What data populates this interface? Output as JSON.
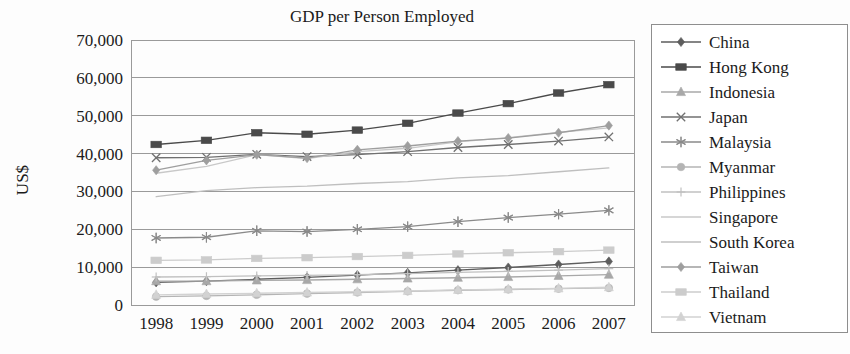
{
  "chart_data": {
    "type": "line",
    "title": "GDP per Person Employed",
    "xlabel": "",
    "ylabel": "US$",
    "x": [
      1998,
      1999,
      2000,
      2001,
      2002,
      2003,
      2004,
      2005,
      2006,
      2007
    ],
    "categories": [
      "1998",
      "1999",
      "2000",
      "2001",
      "2002",
      "2003",
      "2004",
      "2005",
      "2006",
      "2007"
    ],
    "ylim": [
      0,
      70000
    ],
    "yticks": [
      0,
      10000,
      20000,
      30000,
      40000,
      50000,
      60000,
      70000
    ],
    "ytick_labels": [
      "0",
      "10,000",
      "20,000",
      "30,000",
      "40,000",
      "50,000",
      "60,000",
      "70,000"
    ],
    "grid": true,
    "legend_position": "right",
    "series": [
      {
        "name": "China",
        "marker": "diamond",
        "color": "#5d5d5d",
        "values": [
          6000,
          6300,
          6800,
          7300,
          7900,
          8500,
          9200,
          9900,
          10700,
          11500
        ]
      },
      {
        "name": "Hong Kong",
        "marker": "square",
        "color": "#4a4a4a",
        "values": [
          42400,
          43500,
          45500,
          45100,
          46200,
          48000,
          50700,
          53200,
          56000,
          58200
        ]
      },
      {
        "name": "Indonesia",
        "marker": "triangle",
        "color": "#a8a8a8",
        "values": [
          6300,
          6300,
          6500,
          6600,
          6800,
          7000,
          7200,
          7400,
          7700,
          8000
        ]
      },
      {
        "name": "Japan",
        "marker": "cross",
        "color": "#707070",
        "values": [
          38900,
          39000,
          39800,
          39200,
          39700,
          40500,
          41600,
          42400,
          43300,
          44400
        ]
      },
      {
        "name": "Malaysia",
        "marker": "star",
        "color": "#8a8a8a",
        "values": [
          17700,
          17900,
          19600,
          19400,
          20000,
          20700,
          22000,
          23100,
          24000,
          25000
        ]
      },
      {
        "name": "Myanmar",
        "marker": "circle",
        "color": "#b4b4b4",
        "values": [
          2200,
          2400,
          2700,
          3000,
          3300,
          3600,
          3900,
          4100,
          4300,
          4500
        ]
      },
      {
        "name": "Philippines",
        "marker": "plus",
        "color": "#c0c0c0",
        "values": [
          7400,
          7500,
          7700,
          7800,
          8000,
          8300,
          8600,
          8900,
          9200,
          9600
        ]
      },
      {
        "name": "Singapore",
        "marker": "none",
        "color": "#c8c8c8",
        "values": [
          34800,
          36600,
          39700,
          38700,
          40500,
          41400,
          43100,
          44200,
          45600,
          46800
        ]
      },
      {
        "name": "South Korea",
        "marker": "none",
        "color": "#bfbfbf",
        "values": [
          28600,
          30200,
          31000,
          31400,
          32100,
          32600,
          33600,
          34200,
          35200,
          36200
        ]
      },
      {
        "name": "Taiwan",
        "marker": "diamond",
        "color": "#9e9e9e",
        "values": [
          35600,
          38200,
          39700,
          38800,
          41000,
          42000,
          43300,
          44100,
          45500,
          47400
        ]
      },
      {
        "name": "Thailand",
        "marker": "square",
        "color": "#cccccc",
        "values": [
          11800,
          11900,
          12300,
          12500,
          12800,
          13100,
          13500,
          13800,
          14100,
          14500
        ]
      },
      {
        "name": "Vietnam",
        "marker": "triangle",
        "color": "#d2d2d2",
        "values": [
          2700,
          2900,
          3100,
          3300,
          3500,
          3700,
          4000,
          4200,
          4400,
          4700
        ]
      }
    ]
  },
  "figure": {
    "title": "GDP per Person Employed",
    "y_axis_title": "US$"
  }
}
